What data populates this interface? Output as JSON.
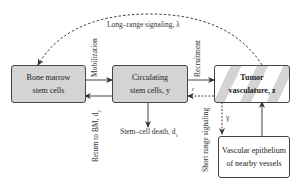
{
  "diagram": {
    "nodes": {
      "bone_marrow": {
        "line1": "Bone marrow",
        "line2": "stem cells"
      },
      "circulating": {
        "line1": "Circulating",
        "line2": "stem cells, y"
      },
      "tumor": {
        "line1": "Tumor",
        "line2": "vasculature, z"
      },
      "vascular": {
        "line1": "Vascular epithelium",
        "line2": "of nearby vessels"
      }
    },
    "edges": {
      "long_range": "Long–range signaling, λ",
      "mobilization": "Mobilization",
      "return_to_bm": "Return to BM, d",
      "return_sub": "2",
      "recruitment": "Recruitment",
      "r_label": "r",
      "short_range": "Short range signaling",
      "gamma": "γ",
      "death": "Stem–cell death, d",
      "death_sub": "1"
    },
    "colors": {
      "box_fill": "#d4d4d4",
      "stroke": "#444444"
    }
  }
}
